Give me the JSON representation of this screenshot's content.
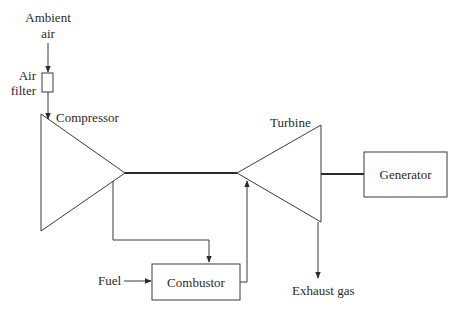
{
  "diagram": {
    "type": "gas-turbine-schematic",
    "labels": {
      "ambient_air_line1": "Ambient",
      "ambient_air_line2": "air",
      "air_filter_line1": "Air",
      "air_filter_line2": "filter",
      "compressor": "Compressor",
      "turbine": "Turbine",
      "generator": "Generator",
      "combustor": "Combustor",
      "fuel": "Fuel",
      "exhaust_gas": "Exhaust gas"
    },
    "colors": {
      "line": "#3a3a3a",
      "text": "#2a2a2a",
      "background": "#ffffff"
    },
    "components": [
      {
        "id": "air-filter",
        "label": "Air filter"
      },
      {
        "id": "compressor",
        "label": "Compressor"
      },
      {
        "id": "combustor",
        "label": "Combustor"
      },
      {
        "id": "turbine",
        "label": "Turbine"
      },
      {
        "id": "generator",
        "label": "Generator"
      }
    ],
    "flows": [
      {
        "from": "Ambient air",
        "to": "Air filter"
      },
      {
        "from": "Air filter",
        "to": "Compressor"
      },
      {
        "from": "Compressor",
        "to": "Combustor"
      },
      {
        "from": "Fuel",
        "to": "Combustor"
      },
      {
        "from": "Combustor",
        "to": "Turbine"
      },
      {
        "from": "Turbine",
        "to": "Exhaust gas"
      },
      {
        "from": "Turbine",
        "to": "Generator",
        "kind": "shaft"
      }
    ]
  }
}
